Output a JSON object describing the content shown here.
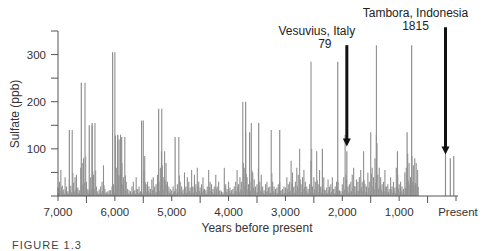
{
  "figure": {
    "caption": "FIGURE 1.3"
  },
  "chart_data": {
    "type": "bar",
    "title": "",
    "xlabel": "Years before present",
    "ylabel": "Sulfate (ppb)",
    "xlim": [
      7000,
      0
    ],
    "ylim": [
      0,
      350
    ],
    "x_ticks": [
      7000,
      6000,
      5000,
      4000,
      3000,
      2000,
      1000,
      0
    ],
    "x_tick_labels": [
      "7,000",
      "6,000",
      "5,000",
      "4,000",
      "3,000",
      "2,000",
      "1,000",
      "Present"
    ],
    "y_ticks": [
      0,
      50,
      100,
      150,
      200,
      250,
      300,
      350
    ],
    "y_tick_labels": {
      "100": "100",
      "200": "200",
      "300": "300"
    },
    "grid": false,
    "bar_color": "#8f8f8f",
    "annotations": [
      {
        "label": "Vesuvius, Italy",
        "sublabel": "79",
        "year_bp": 1920,
        "arrow_top_value": 320,
        "arrow_bottom_value": 105
      },
      {
        "label": "Tambora, Indonesia",
        "sublabel": "1815",
        "year_bp": 185,
        "arrow_top_value": 358,
        "arrow_bottom_value": 88
      }
    ],
    "peaks": [
      {
        "x": 6800,
        "y": 140
      },
      {
        "x": 6590,
        "y": 240
      },
      {
        "x": 6450,
        "y": 150
      },
      {
        "x": 6400,
        "y": 155
      },
      {
        "x": 6040,
        "y": 305
      },
      {
        "x": 5990,
        "y": 128
      },
      {
        "x": 5950,
        "y": 130
      },
      {
        "x": 5880,
        "y": 125
      },
      {
        "x": 5530,
        "y": 160
      },
      {
        "x": 5230,
        "y": 185
      },
      {
        "x": 5180,
        "y": 95
      },
      {
        "x": 4940,
        "y": 125
      },
      {
        "x": 3700,
        "y": 200
      },
      {
        "x": 3630,
        "y": 135
      },
      {
        "x": 3470,
        "y": 155
      },
      {
        "x": 3100,
        "y": 140
      },
      {
        "x": 2080,
        "y": 285
      },
      {
        "x": 1920,
        "y": 95
      },
      {
        "x": 1400,
        "y": 130
      },
      {
        "x": 860,
        "y": 135
      },
      {
        "x": 780,
        "y": 320
      },
      {
        "x": 1030,
        "y": 95
      },
      {
        "x": 2350,
        "y": 100
      },
      {
        "x": 2550,
        "y": 75
      },
      {
        "x": 185,
        "y": 90
      },
      {
        "x": 100,
        "y": 80
      },
      {
        "x": 40,
        "y": 85
      }
    ],
    "series_step_years": 25,
    "series_start_year": 7000,
    "values": [
      18,
      30,
      55,
      22,
      14,
      40,
      20,
      10,
      35,
      22,
      140,
      28,
      40,
      45,
      18,
      12,
      60,
      70,
      80,
      240,
      30,
      15,
      12,
      40,
      150,
      45,
      155,
      20,
      10,
      14,
      20,
      30,
      65,
      15,
      8,
      10,
      12,
      12,
      20,
      25,
      305,
      60,
      128,
      120,
      130,
      70,
      40,
      125,
      30,
      15,
      12,
      10,
      20,
      30,
      12,
      40,
      15,
      20,
      10,
      8,
      160,
      85,
      25,
      30,
      20,
      15,
      35,
      40,
      20,
      25,
      45,
      30,
      60,
      185,
      40,
      95,
      70,
      30,
      20,
      15,
      12,
      20,
      10,
      15,
      25,
      125,
      30,
      20,
      14,
      50,
      20,
      40,
      30,
      18,
      55,
      20,
      45,
      25,
      60,
      30,
      18,
      25,
      40,
      15,
      12,
      20,
      55,
      30,
      25,
      15,
      20,
      45,
      20,
      30,
      12,
      10,
      8,
      60,
      25,
      15,
      30,
      18,
      12,
      15,
      20,
      30,
      55,
      25,
      40,
      30,
      200,
      60,
      135,
      40,
      25,
      30,
      155,
      50,
      35,
      20,
      25,
      60,
      30,
      45,
      20,
      12,
      25,
      30,
      18,
      20,
      140,
      30,
      20,
      15,
      18,
      25,
      30,
      12,
      15,
      20,
      18,
      40,
      25,
      30,
      75,
      50,
      20,
      30,
      60,
      45,
      100,
      25,
      40,
      55,
      30,
      20,
      15,
      25,
      285,
      20,
      40,
      30,
      95,
      25,
      55,
      20,
      15,
      40,
      12,
      18,
      35,
      20,
      25,
      40,
      15,
      20,
      30,
      30,
      12,
      10,
      25,
      40,
      130,
      35,
      20,
      25,
      30,
      45,
      60,
      20,
      35,
      30,
      40,
      55,
      30,
      95,
      25,
      20,
      50,
      30,
      135,
      60,
      40,
      80,
      320,
      45,
      60,
      40,
      25,
      30,
      55,
      20,
      25,
      15,
      40,
      20,
      30,
      18,
      60,
      45,
      25,
      30,
      20,
      15,
      50,
      60,
      90,
      70,
      40,
      85,
      65,
      80,
      70,
      55
    ],
    "series": [
      {
        "name": "Sulfate (ppb)",
        "values_ref": "values"
      }
    ]
  }
}
